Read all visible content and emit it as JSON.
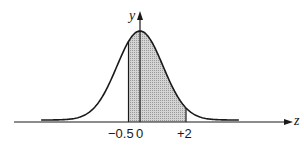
{
  "diagram": {
    "type": "normal-distribution-shaded-area",
    "axes": {
      "x_label": "z",
      "y_label": "y"
    },
    "ticks": [
      {
        "value": -0.5,
        "label": "−0.5"
      },
      {
        "value": 0,
        "label": "0"
      },
      {
        "value": 2,
        "label": "+2"
      }
    ],
    "shaded_region": {
      "from": -0.5,
      "to": 2
    },
    "colors": {
      "line": "#1a1a1a",
      "shade": "#c8c8c8",
      "background": "#ffffff"
    }
  }
}
